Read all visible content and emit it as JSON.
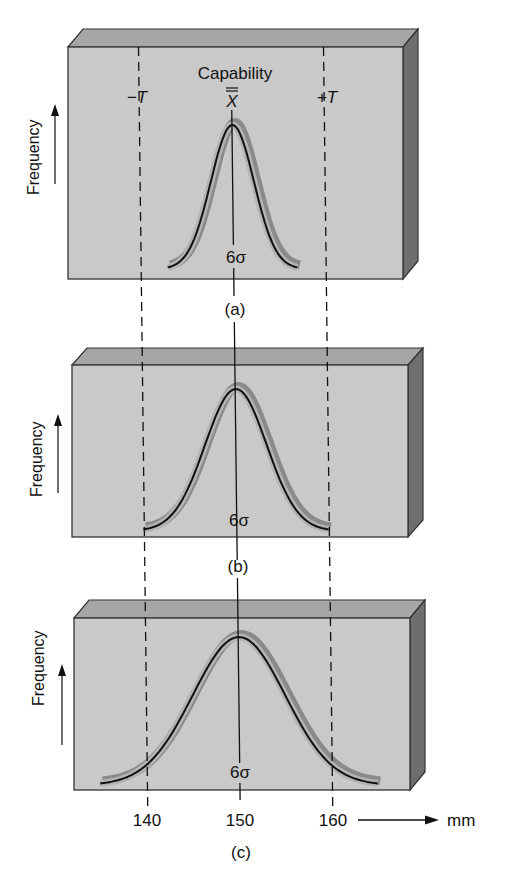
{
  "figure": {
    "colors": {
      "face": "#c9c9c9",
      "top": "#a6a6a6",
      "side": "#6e6e6e",
      "edge": "#333333",
      "curve_band": "#8a8a8a",
      "curve_band_light": "#b4b4b4",
      "curve_line": "#111111",
      "text": "#111111"
    },
    "header": {
      "capability_label": "Capability",
      "minus_t_label": "−T",
      "xbar_label": "X",
      "plus_t_label": "+T"
    },
    "axis": {
      "ylabel": "Frequency",
      "xunit": "mm",
      "ticks": [
        "140",
        "150",
        "160"
      ]
    },
    "panels": [
      {
        "id": "a",
        "caption": "(a)",
        "sigma_label": "6σ",
        "sigma_mm": 2.0,
        "spread_mm": [
          143,
          157
        ],
        "box": {
          "x": 68,
          "y": 47,
          "w": 335,
          "h": 232,
          "depth": 15,
          "lift": 18
        },
        "peak_y": 125,
        "base_y": 269
      },
      {
        "id": "b",
        "caption": "(b)",
        "sigma_label": "6σ",
        "sigma_mm": 3.33,
        "spread_mm": [
          140,
          160
        ],
        "box": {
          "x": 72,
          "y": 365,
          "w": 336,
          "h": 172,
          "depth": 15,
          "lift": 17
        },
        "peak_y": 389,
        "base_y": 531
      },
      {
        "id": "c",
        "caption": "(c)",
        "sigma_label": "6σ",
        "sigma_mm": 5.0,
        "spread_mm": [
          135,
          165
        ],
        "box": {
          "x": 74,
          "y": 618,
          "w": 336,
          "h": 172,
          "depth": 15,
          "lift": 18
        },
        "peak_y": 637,
        "base_y": 785
      }
    ]
  },
  "chart_data": {
    "type": "diagram",
    "title": "Capability",
    "xlabel": "mm",
    "ylabel": "Frequency",
    "x_ticks": [
      140,
      150,
      160
    ],
    "tolerance": {
      "lower_label": "-T",
      "lower": 140,
      "upper_label": "+T",
      "upper": 160,
      "mean_label": "X double-bar",
      "mean": 150
    },
    "series": [
      {
        "name": "(a)",
        "distribution": "normal",
        "mean": 150,
        "six_sigma_range": [
          143,
          157
        ]
      },
      {
        "name": "(b)",
        "distribution": "normal",
        "mean": 150,
        "six_sigma_range": [
          140,
          160
        ]
      },
      {
        "name": "(c)",
        "distribution": "normal",
        "mean": 150,
        "six_sigma_range": [
          135,
          165
        ]
      }
    ]
  }
}
